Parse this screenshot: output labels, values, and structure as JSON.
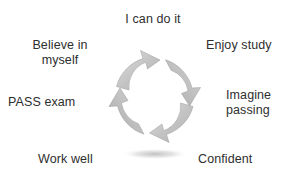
{
  "diagram": {
    "title": "I can do it",
    "type": "cyclical-process",
    "center_graphic": {
      "name": "four-segment-circular-arrow-ring",
      "segment_count": 4,
      "direction": "clockwise",
      "fill_color": "#bcbcbc",
      "highlight_color": "#e2e2e2",
      "shadow_color": "#cfcfcf",
      "hole_color": "#ffffff"
    },
    "labels": [
      {
        "id": "believe",
        "text": "Believe in\nmyself",
        "position": "top-left"
      },
      {
        "id": "enjoy",
        "text": "Enjoy study",
        "position": "top-right"
      },
      {
        "id": "pass",
        "text": "PASS exam",
        "position": "middle-left"
      },
      {
        "id": "imagine",
        "text": "Imagine\npassing",
        "position": "middle-right"
      },
      {
        "id": "work",
        "text": "Work well",
        "position": "bottom-left"
      },
      {
        "id": "confident",
        "text": "Confident",
        "position": "bottom-right"
      }
    ]
  },
  "colors": {
    "background": "#ffffff",
    "text": "#2e2e2e",
    "ring_gray": "#bcbcbc"
  }
}
